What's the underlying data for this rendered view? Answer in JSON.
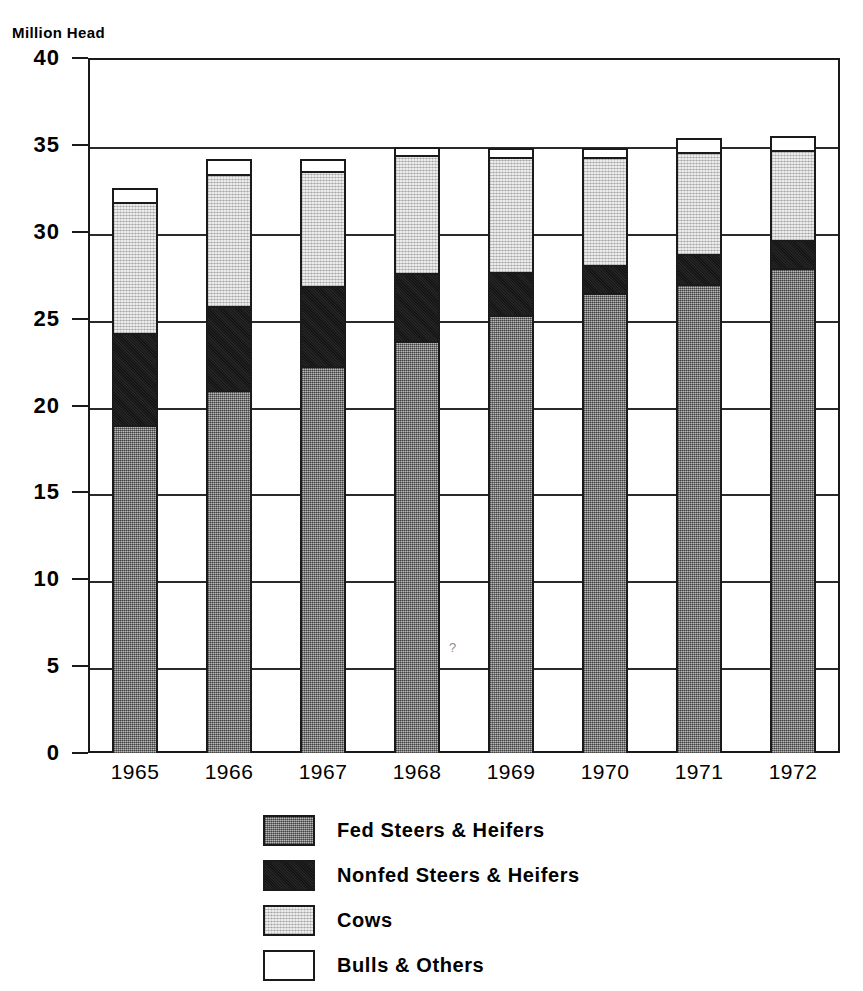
{
  "chart_data": {
    "type": "bar",
    "stacked": true,
    "title": "",
    "ylabel": "Million Head",
    "xlabel": "",
    "ylim": [
      0,
      40
    ],
    "ytick_step": 5,
    "yticks": [
      "0",
      "5",
      "10",
      "15",
      "20",
      "25",
      "30",
      "35",
      "40"
    ],
    "grid": true,
    "grid_axis": "y",
    "legend_position": "bottom-center",
    "categories": [
      "1965",
      "1966",
      "1967",
      "1968",
      "1969",
      "1970",
      "1971",
      "1972"
    ],
    "series": [
      {
        "name": "Fed Steers & Heifers",
        "color": "#8a8a8a",
        "values": [
          18.9,
          20.9,
          22.3,
          23.7,
          25.2,
          26.5,
          27.0,
          27.9
        ]
      },
      {
        "name": "Nonfed Steers & Heifers",
        "color": "#191919",
        "values": [
          5.3,
          4.8,
          4.6,
          3.9,
          2.5,
          1.6,
          1.7,
          1.6
        ]
      },
      {
        "name": "Cows",
        "color": "#d2d2d2",
        "values": [
          7.5,
          7.6,
          6.6,
          6.8,
          6.6,
          6.2,
          5.9,
          5.2
        ]
      },
      {
        "name": "Bulls & Others",
        "color": "#ffffff",
        "values": [
          0.8,
          0.9,
          0.7,
          0.5,
          0.5,
          0.5,
          0.8,
          0.8
        ]
      }
    ],
    "totals": [
      32.5,
      34.2,
      34.2,
      34.9,
      34.8,
      34.8,
      35.4,
      35.5
    ]
  },
  "axis": {
    "unit_label": "Million Head"
  },
  "legend": {
    "items": [
      {
        "label": "Fed Steers & Heifers",
        "swatch": "fill-fed"
      },
      {
        "label": "Nonfed Steers & Heifers",
        "swatch": "fill-nonfed"
      },
      {
        "label": "Cows",
        "swatch": "fill-cows"
      },
      {
        "label": "Bulls & Others",
        "swatch": "fill-bulls"
      }
    ]
  },
  "artifacts": {
    "stray_question_mark": "?"
  }
}
